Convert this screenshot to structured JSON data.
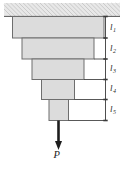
{
  "figure": {
    "background_color": "#ffffff",
    "block_fill": "#dcdcdc",
    "block_stroke": "#6e6e6e",
    "support_fill": "#e8e8e8",
    "line_color": "#3a3a3a"
  },
  "support": {
    "name": "fixed-support-hatching",
    "x": 4,
    "y": 3,
    "width": 116,
    "height": 13
  },
  "blocks": [
    {
      "id": "segment-1",
      "label": "l",
      "sub": "1",
      "x": 12.5,
      "y": 16.5,
      "width": 91.5,
      "height": 21.5
    },
    {
      "id": "segment-2",
      "label": "l",
      "sub": "2",
      "x": 22.0,
      "y": 38.0,
      "width": 72.0,
      "height": 21.0
    },
    {
      "id": "segment-3",
      "label": "l",
      "sub": "3",
      "x": 32.0,
      "y": 59.0,
      "width": 52.0,
      "height": 20.5
    },
    {
      "id": "segment-4",
      "label": "l",
      "sub": "4",
      "x": 41.5,
      "y": 79.5,
      "width": 33.0,
      "height": 20.0
    },
    {
      "id": "segment-5",
      "label": "l",
      "sub": "5",
      "x": 49.0,
      "y": 99.5,
      "width": 19.5,
      "height": 21.0
    }
  ],
  "dimension": {
    "axis_x": 105.5,
    "top": 16.5,
    "bottom": 120.5,
    "tick_half_width": 2.2,
    "label_x": 110,
    "labels": [
      {
        "text": "l",
        "sub": "1",
        "y": 29.5
      },
      {
        "text": "l",
        "sub": "2",
        "y": 50.5
      },
      {
        "text": "l",
        "sub": "3",
        "y": 71.0
      },
      {
        "text": "l",
        "sub": "4",
        "y": 91.0
      },
      {
        "text": "l",
        "sub": "5",
        "y": 112.0
      }
    ]
  },
  "load": {
    "name": "axial-load-arrow",
    "label": "P",
    "label_x": 53.5,
    "label_y": 158,
    "shaft_x": 58.5,
    "shaft_top": 120.5,
    "shaft_bottom": 142,
    "head_width": 7,
    "head_height": 8
  }
}
